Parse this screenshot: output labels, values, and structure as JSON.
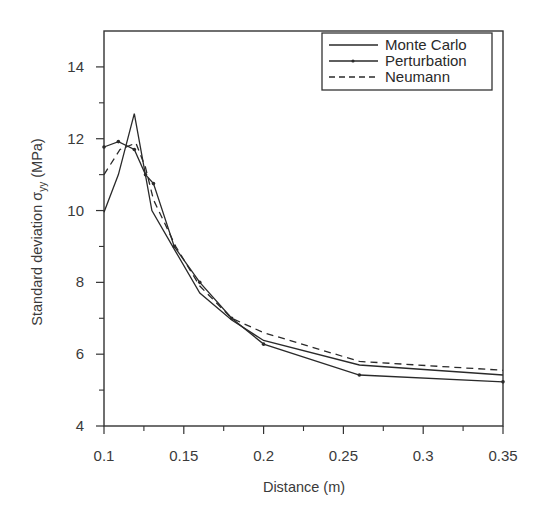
{
  "chart_data": {
    "type": "line",
    "title": "",
    "xlabel": "Distance (m)",
    "ylabel_main": "Standard deviation σ",
    "ylabel_sub": "yy",
    "ylabel_unit": " (MPa)",
    "ylabel": "Standard deviation σyy (MPa)",
    "xlim": [
      0.1,
      0.35
    ],
    "ylim": [
      4,
      15
    ],
    "x_ticks": [
      0.1,
      0.15,
      0.2,
      0.25,
      0.3,
      0.35
    ],
    "x_tick_labels": [
      "0.1",
      "0.15",
      "0.2",
      "0.25",
      "0.3",
      "0.35"
    ],
    "x_minor_ticks": [
      0.125,
      0.175,
      0.225,
      0.275,
      0.325
    ],
    "y_ticks": [
      4,
      6,
      8,
      10,
      12,
      14
    ],
    "y_tick_labels": [
      "4",
      "6",
      "8",
      "10",
      "12",
      "14"
    ],
    "y_minor_ticks": [
      5,
      7,
      9,
      11,
      13
    ],
    "grid": false,
    "legend_position": "upper right",
    "series": [
      {
        "name": "Monte Carlo",
        "style": "solid",
        "marker": "none",
        "x": [
          0.1,
          0.109,
          0.119,
          0.13,
          0.145,
          0.16,
          0.18,
          0.2,
          0.26,
          0.35
        ],
        "y": [
          9.95,
          11.0,
          12.7,
          10.0,
          8.85,
          7.7,
          6.95,
          6.38,
          5.7,
          5.42
        ]
      },
      {
        "name": "Perturbation",
        "style": "solid",
        "marker": "dot",
        "x": [
          0.1,
          0.109,
          0.119,
          0.126,
          0.131,
          0.144,
          0.16,
          0.18,
          0.2,
          0.26,
          0.35
        ],
        "y": [
          11.77,
          11.92,
          11.7,
          11.0,
          10.75,
          9.0,
          8.0,
          7.0,
          6.28,
          5.42,
          5.23
        ]
      },
      {
        "name": "Neumann",
        "style": "dashed",
        "marker": "none",
        "x": [
          0.1,
          0.11,
          0.12,
          0.126,
          0.131,
          0.145,
          0.16,
          0.18,
          0.2,
          0.26,
          0.35
        ],
        "y": [
          11.0,
          11.7,
          11.88,
          11.2,
          10.3,
          9.0,
          7.9,
          7.0,
          6.6,
          5.8,
          5.55
        ]
      }
    ]
  },
  "legend": {
    "items": [
      "Monte Carlo",
      "Perturbation",
      "Neumann"
    ]
  },
  "colors": {
    "line": "#2a2a2a",
    "axis": "#333333",
    "text": "#3a3a3a"
  }
}
